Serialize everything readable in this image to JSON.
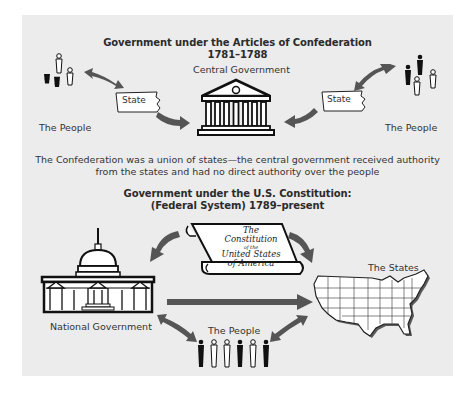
{
  "top_section": {
    "title_line1": "Government under the Articles of Confederation",
    "title_line2": "1781–1788",
    "central_label": "Central Government",
    "state_left": "State",
    "state_right": "State",
    "people_left": "The People",
    "people_right": "The People",
    "caption_line1": "The Confederation was a union of states—the central government received authority",
    "caption_line2": "from the states and had no direct authority over the people"
  },
  "bottom_section": {
    "title_line1": "Government under the U.S. Constitution:",
    "title_line2": "(Federal System) 1789–present",
    "scroll_line1": "The Constitution",
    "scroll_line2": "of the",
    "scroll_line3": "United States",
    "scroll_line4": "of America",
    "national_label": "National Government",
    "states_label": "The States",
    "people_label": "The People"
  },
  "colors": {
    "panel_bg": "#ececec",
    "arrow": "#555555",
    "ink": "#1a1a1a"
  }
}
